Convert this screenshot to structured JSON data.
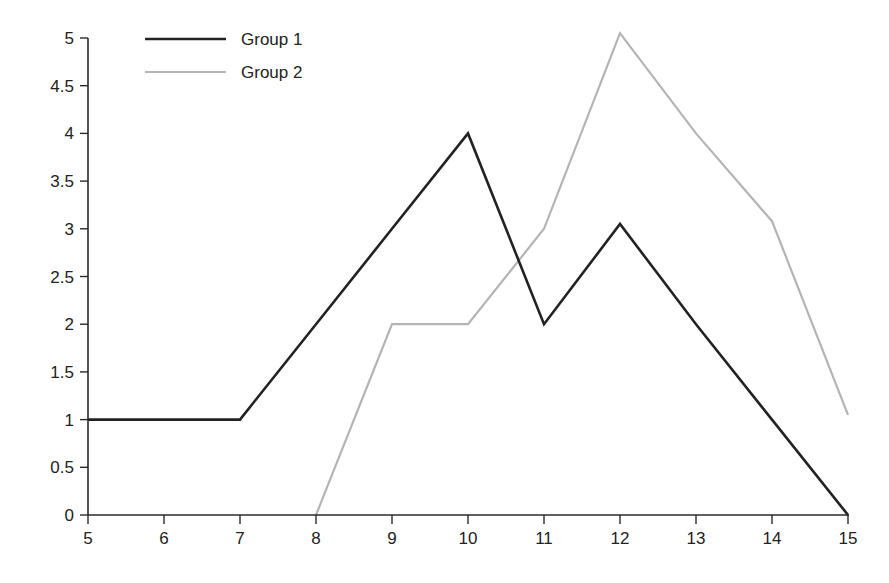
{
  "chart_data": {
    "type": "line",
    "title": "",
    "xlabel": "",
    "ylabel": "",
    "xlim": [
      5,
      15
    ],
    "ylim": [
      0,
      5
    ],
    "grid": false,
    "legend_position": "upper left",
    "x_ticks": [
      5,
      6,
      7,
      8,
      9,
      10,
      11,
      12,
      13,
      14,
      15
    ],
    "x_tick_labels": [
      "5",
      "6",
      "7",
      "8",
      "9",
      "10",
      "11",
      "12",
      "13",
      "14",
      "15"
    ],
    "y_ticks": [
      0,
      0.5,
      1,
      1.5,
      2,
      2.5,
      3,
      3.5,
      4,
      4.5,
      5
    ],
    "y_tick_labels": [
      "0",
      "0.5",
      "1",
      "1.5",
      "2",
      "2.5",
      "3",
      "3.5",
      "4",
      "4.5",
      "5"
    ],
    "series": [
      {
        "name": "Group 1",
        "color": "#222222",
        "width": 2.6,
        "x": [
          5,
          6,
          7,
          8,
          9,
          10,
          11,
          12,
          13,
          14,
          15
        ],
        "values": [
          1,
          1,
          1,
          2,
          3,
          4,
          2,
          3.05,
          2,
          1,
          0
        ]
      },
      {
        "name": "Group 2",
        "color": "#b4b4b4",
        "width": 2.2,
        "x": [
          8,
          9,
          10,
          11,
          12,
          13,
          14,
          15
        ],
        "values": [
          0,
          2,
          2,
          3,
          5.05,
          4,
          3.08,
          1.05
        ]
      }
    ]
  },
  "legend": {
    "items": [
      {
        "label": "Group 1",
        "color": "#222222"
      },
      {
        "label": "Group 2",
        "color": "#b4b4b4"
      }
    ]
  }
}
